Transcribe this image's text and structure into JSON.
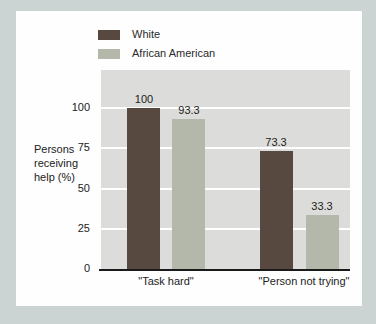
{
  "figure": {
    "background_color": "#cbd4d2",
    "panel_color": "#fefefe",
    "plot_background_color": "#dcddda",
    "gridline_color": "#ffffff"
  },
  "legend": {
    "position": "top-left",
    "items": [
      {
        "label": "White"
      },
      {
        "label": "African American"
      }
    ]
  },
  "chart_data": {
    "type": "bar",
    "categories": [
      "\"Task hard\"",
      "\"Person not\ntrying\""
    ],
    "series": [
      {
        "name": "White",
        "color": "#57493f",
        "values": [
          100,
          73.3
        ]
      },
      {
        "name": "African American",
        "color": "#b3b8ab",
        "values": [
          93.3,
          33.3
        ]
      }
    ],
    "title": "",
    "xlabel": "",
    "ylabel": "Persons receiving help (%)",
    "ylabel_lines": [
      "Persons",
      "receiving",
      "help (%)"
    ],
    "ylim": [
      0,
      123
    ],
    "yticks": [
      0,
      25,
      50,
      75,
      100
    ],
    "ytick_labels": [
      "100",
      "75",
      "50",
      "25",
      "0"
    ],
    "grid": true,
    "value_labels_shown": true
  }
}
